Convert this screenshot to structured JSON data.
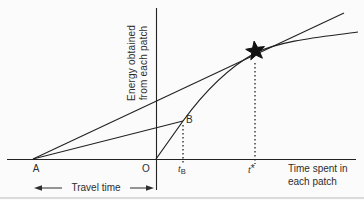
{
  "axes": {
    "y_label_line1": "Energy obtained",
    "y_label_line2": "from each patch",
    "x_label_line1": "Time spent in",
    "x_label_line2": "each patch"
  },
  "points": {
    "travel_start": "A",
    "origin": "O",
    "patch_point": "B",
    "t_b_letter": "t",
    "t_b_subscript": "B",
    "t_star_letter": "t",
    "t_star_mark": "*"
  },
  "annotations": {
    "travel_time": "Travel time"
  },
  "icons": {
    "optimum_marker": "star"
  },
  "colors": {
    "line": "#222222",
    "text": "#2e2e2e",
    "background": "#fbfbfb",
    "scan_edge": "#cfcfcf"
  }
}
